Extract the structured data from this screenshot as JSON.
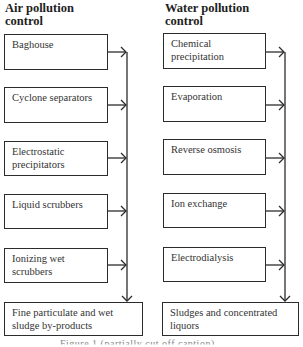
{
  "air": {
    "heading_line1": "Air pollution",
    "heading_line2": "control",
    "boxes": [
      {
        "label": "Baghouse"
      },
      {
        "label": "Cyclone separators"
      },
      {
        "label": "Electrostatic precipitators"
      },
      {
        "label": "Liquid scrubbers"
      },
      {
        "label": "Ionizing wet scrubbers"
      }
    ],
    "output": "Fine particulate and wet sludge by-products"
  },
  "water": {
    "heading_line1": "Water pollution",
    "heading_line2": "control",
    "boxes": [
      {
        "label": "Chemical precipitation"
      },
      {
        "label": "Evaporation"
      },
      {
        "label": "Reverse osmosis"
      },
      {
        "label": "Ion exchange"
      },
      {
        "label": "Electrodialysis"
      }
    ],
    "output": "Sludges and concentrated liquors"
  },
  "caption": "Figure 1 (partially cut off caption)"
}
